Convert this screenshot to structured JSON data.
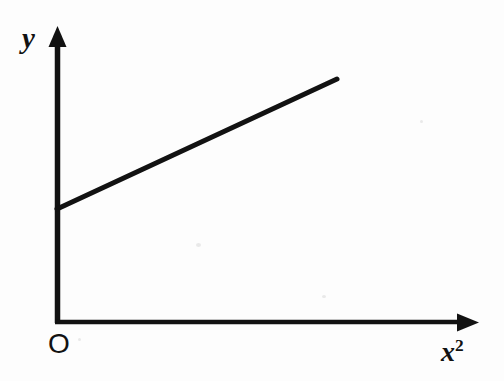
{
  "figure": {
    "background_color": "#fdfdfd",
    "ink_color": "#121212",
    "origin_label": "O",
    "y_axis_label": "y",
    "x_axis_label_base": "x",
    "x_axis_label_exponent": "2"
  },
  "chart_data": {
    "type": "line",
    "title": "",
    "subtitle": "",
    "xlabel": "x²",
    "ylabel": "y",
    "grid": false,
    "legend": null,
    "annotations": [
      {
        "text": "O",
        "role": "origin-marker"
      }
    ],
    "axes": {
      "x": {
        "label": "x²",
        "ticks": [],
        "ticklabels": [],
        "arrow": true,
        "range_shown": "0 to positive"
      },
      "y": {
        "label": "y",
        "ticks": [],
        "ticklabels": [],
        "arrow": true,
        "range_shown": "0 to positive"
      }
    },
    "series": [
      {
        "name": "linear relation",
        "style": "solid",
        "width_px": 5,
        "color": "#121212",
        "x": [
          0,
          1
        ],
        "y": [
          0.37,
          0.83
        ],
        "description": "straight line with positive y-intercept and positive slope, drawn from the y-axis to mid-upper-right",
        "pixel_endpoints": [
          {
            "x": 57,
            "y": 209
          },
          {
            "x": 337,
            "y": 79
          }
        ]
      }
    ]
  }
}
